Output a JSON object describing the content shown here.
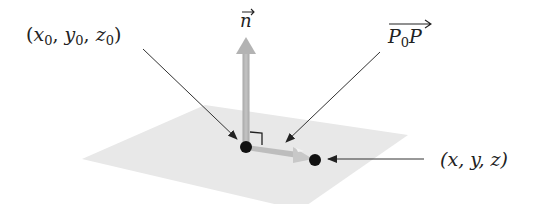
{
  "diagram": {
    "type": "plane-normal-vector",
    "labels": {
      "point_p0": {
        "open": "(",
        "x": "x",
        "x_sub": "0",
        "sep1": ", ",
        "y": "y",
        "y_sub": "0",
        "sep2": ", ",
        "z": "z",
        "z_sub": "0",
        "close": ")"
      },
      "point_p": {
        "text": "(x, y, z)"
      },
      "normal_vector": {
        "text": "n"
      },
      "vector_p0p": {
        "p": "P",
        "p_sub": "0",
        "p2": "P"
      }
    },
    "colors": {
      "plane": "#e6e6e6",
      "vector": "#b5b5b5",
      "point": "#111111",
      "leader": "#333333"
    }
  }
}
